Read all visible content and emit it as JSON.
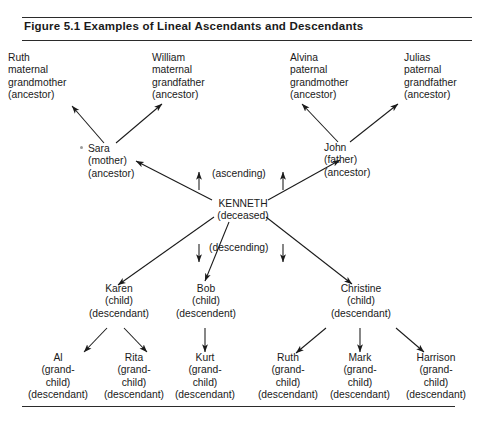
{
  "figure": {
    "title": "Figure  5.1  Examples of Lineal Ascendants and Descendants",
    "ink_color": "#1a1a1a",
    "rule_color": "#2b2b2b"
  },
  "labels": {
    "ascending": "(ascending)",
    "descending": "(descending)"
  },
  "generations": {
    "grandparents": [
      {
        "name": "Ruth",
        "line2": "maternal",
        "line3": "grandmother",
        "line4": "(ancestor)"
      },
      {
        "name": "William",
        "line2": "maternal",
        "line3": "grandfather",
        "line4": "(ancestor)"
      },
      {
        "name": "Alvina",
        "line2": "paternal",
        "line3": "grandmother",
        "line4": "(ancestor)"
      },
      {
        "name": "Julias",
        "line2": "paternal",
        "line3": "grandfather",
        "line4": "(ancestor)"
      }
    ],
    "parents": [
      {
        "name": "Sara",
        "line2": "(mother)",
        "line3": "(ancestor)"
      },
      {
        "name": "John",
        "line2": "(father)",
        "line3": "(ancestor)"
      }
    ],
    "subject": {
      "name": "KENNETH",
      "line2": "(deceased)"
    },
    "children": [
      {
        "name": "Karen",
        "line2": "(child)",
        "line3": "(descendant)"
      },
      {
        "name": "Bob",
        "line2": "(child)",
        "line3": "(descendent)"
      },
      {
        "name": "Christine",
        "line2": "(child)",
        "line3": "(descendant)"
      }
    ],
    "grandchildren": [
      {
        "name": "Al",
        "line2": "(grand-",
        "line3": "child)",
        "line4": "(descendant)"
      },
      {
        "name": "Rita",
        "line2": "(grand-",
        "line3": "child)",
        "line4": "(descendant)"
      },
      {
        "name": "Kurt",
        "line2": "(grand-",
        "line3": "child)",
        "line4": "(descendant)"
      },
      {
        "name": "Ruth",
        "line2": "(grand-",
        "line3": "child)",
        "line4": "(descendant)"
      },
      {
        "name": "Mark",
        "line2": "(grand-",
        "line3": "child)",
        "line4": "(descendant)"
      },
      {
        "name": "Harrison",
        "line2": "(grand-",
        "line3": "child)",
        "line4": "(descendant)"
      }
    ]
  }
}
